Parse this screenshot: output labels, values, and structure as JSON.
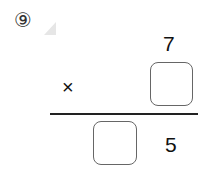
{
  "problem": {
    "number_label": "⑨",
    "marker": "triangle-marker",
    "multiplicand": "7",
    "operator": "×",
    "multiplier_blank": "",
    "product_tens_blank": "",
    "product_ones": "5"
  }
}
